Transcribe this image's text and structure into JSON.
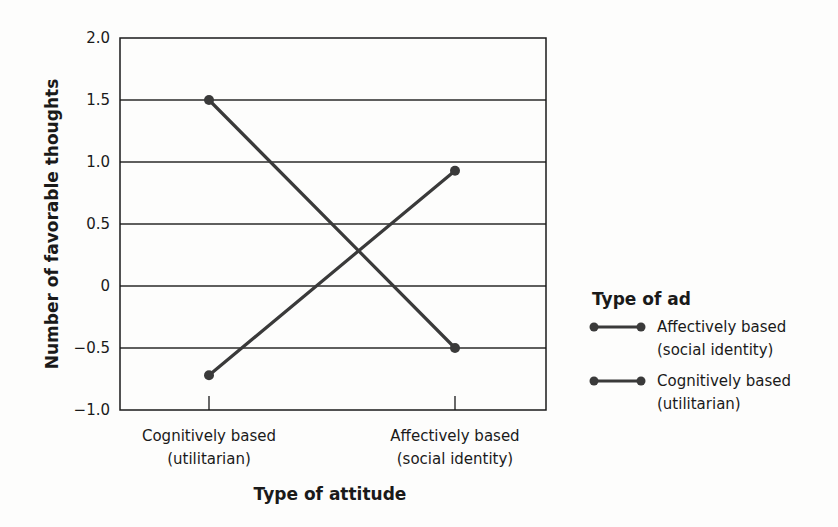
{
  "chart_data": {
    "type": "line",
    "title": "",
    "xlabel": "Type of attitude",
    "ylabel": "Number of favorable thoughts",
    "ylim": [
      -1.0,
      2.0
    ],
    "yticks": [
      "2.0",
      "1.5",
      "1.0",
      "0.5",
      "0",
      "−0.5",
      "−1.0"
    ],
    "ytick_values": [
      2.0,
      1.5,
      1.0,
      0.5,
      0,
      -0.5,
      -1.0
    ],
    "grid": true,
    "categories": [
      {
        "line1": "Cognitively based",
        "line2": "(utilitarian)"
      },
      {
        "line1": "Affectively based",
        "line2": "(social identity)"
      }
    ],
    "legend": {
      "title": "Type of ad",
      "position": "right",
      "entries": [
        {
          "line1": "Affectively based",
          "line2": "(social identity)"
        },
        {
          "line1": "Cognitively based",
          "line2": "(utilitarian)"
        }
      ]
    },
    "series": [
      {
        "name": "Affectively based (social identity)",
        "values": [
          -0.72,
          0.93
        ],
        "color": "#3a3a3a"
      },
      {
        "name": "Cognitively based (utilitarian)",
        "values": [
          1.5,
          -0.5
        ],
        "color": "#3a3a3a"
      }
    ]
  }
}
